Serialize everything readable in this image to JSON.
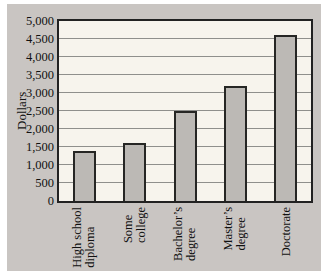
{
  "colors": {
    "page-bg": "#ffffff",
    "panel-bg": "#c9c5c2",
    "plot-bg": "#f7f4ed",
    "plot-border": "#222222",
    "grid": "#8f8f8c",
    "bar-fill": "#bcb9b5",
    "bar-border": "#262624",
    "text": "#111111"
  },
  "chart_data": {
    "type": "bar",
    "title": "",
    "xlabel": "",
    "ylabel": "Dollars",
    "ylim": [
      0,
      5000
    ],
    "ytick_step": 500,
    "grid": "horizontal",
    "legend": "none",
    "yticks": [
      {
        "value": 0,
        "label": "0"
      },
      {
        "value": 500,
        "label": "500"
      },
      {
        "value": 1000,
        "label": "1,000"
      },
      {
        "value": 1500,
        "label": "1,500"
      },
      {
        "value": 2000,
        "label": "2,000"
      },
      {
        "value": 2500,
        "label": "2,500"
      },
      {
        "value": 3000,
        "label": "3,000"
      },
      {
        "value": 3500,
        "label": "3,500"
      },
      {
        "value": 4000,
        "label": "4,000"
      },
      {
        "value": 4500,
        "label": "4,500"
      },
      {
        "value": 5000,
        "label": "5,000"
      }
    ],
    "categories": [
      "High school diploma",
      "Some college",
      "Bachelor’s degree",
      "Master’s degree",
      "Doctorate"
    ],
    "category_lines": [
      [
        "High school",
        "diploma"
      ],
      [
        "Some",
        "college"
      ],
      [
        "Bachelor’s",
        "degree"
      ],
      [
        "Master’s",
        "degree"
      ],
      [
        "Doctorate"
      ]
    ],
    "values": [
      1400,
      1600,
      2500,
      3200,
      4600
    ],
    "category_label_rotation_deg": 90
  }
}
